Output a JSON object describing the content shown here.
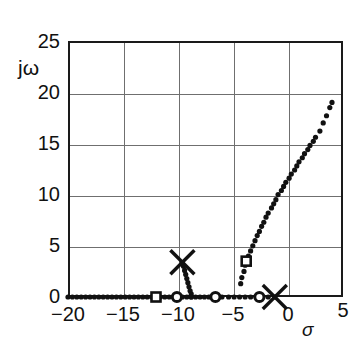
{
  "chart_data": {
    "type": "scatter",
    "title": "",
    "subtitle": "",
    "xlabel": "σ",
    "ylabel": "jω",
    "xlim": [
      -20,
      5
    ],
    "ylim": [
      0,
      25
    ],
    "xticks": [
      -20,
      -15,
      -10,
      -5,
      0,
      5
    ],
    "xticklabels": [
      "−20",
      "−15",
      "−10",
      "−5",
      "0",
      "5"
    ],
    "yticks": [
      0,
      5,
      10,
      15,
      20,
      25
    ],
    "yticklabels": [
      "0",
      "5",
      "10",
      "15",
      "20",
      "25"
    ],
    "grid": true,
    "grid_color": "#6f6f6f",
    "frame_color": "#1a1a1a",
    "legend": "none",
    "series": [
      {
        "name": "real-axis-locus",
        "marker": "dot",
        "color": "#111111",
        "points": [
          [
            -20.0,
            0
          ],
          [
            -19.6,
            0
          ],
          [
            -19.2,
            0
          ],
          [
            -18.8,
            0
          ],
          [
            -18.4,
            0
          ],
          [
            -18.0,
            0
          ],
          [
            -17.6,
            0
          ],
          [
            -17.2,
            0
          ],
          [
            -16.8,
            0
          ],
          [
            -16.4,
            0
          ],
          [
            -16.0,
            0
          ],
          [
            -15.6,
            0
          ],
          [
            -15.2,
            0
          ],
          [
            -14.8,
            0
          ],
          [
            -14.4,
            0
          ],
          [
            -14.0,
            0
          ],
          [
            -13.6,
            0
          ],
          [
            -13.2,
            0
          ],
          [
            -12.8,
            0
          ],
          [
            -12.4,
            0
          ],
          [
            -12.0,
            0
          ],
          [
            -11.6,
            0
          ],
          [
            -11.2,
            0
          ],
          [
            -10.8,
            0
          ],
          [
            -10.4,
            0
          ],
          [
            -10.0,
            0
          ],
          [
            -9.6,
            0
          ],
          [
            -9.2,
            0
          ],
          [
            -8.8,
            0
          ],
          [
            -8.4,
            0
          ],
          [
            -8.0,
            0
          ],
          [
            -7.6,
            0
          ],
          [
            -7.2,
            0
          ],
          [
            -6.8,
            0
          ],
          [
            -6.4,
            0
          ],
          [
            -6.0,
            0
          ],
          [
            -5.4,
            0
          ],
          [
            -4.9,
            0
          ],
          [
            -4.4,
            0
          ],
          [
            -3.9,
            0
          ],
          [
            -3.4,
            0
          ],
          [
            -2.9,
            0
          ],
          [
            -2.3,
            0
          ],
          [
            -1.8,
            0
          ],
          [
            -1.2,
            0
          ]
        ]
      },
      {
        "name": "upper-branch-locus",
        "marker": "dot",
        "color": "#111111",
        "points": [
          [
            -4.3,
            1.3
          ],
          [
            -4.2,
            1.9
          ],
          [
            -4.0,
            2.5
          ],
          [
            -3.9,
            3.1
          ],
          [
            -3.8,
            3.5
          ],
          [
            -3.6,
            4.0
          ],
          [
            -3.4,
            4.5
          ],
          [
            -3.2,
            5.0
          ],
          [
            -3.0,
            5.5
          ],
          [
            -2.8,
            6.0
          ],
          [
            -2.6,
            6.4
          ],
          [
            -2.4,
            6.9
          ],
          [
            -2.2,
            7.3
          ],
          [
            -2.0,
            7.8
          ],
          [
            -1.8,
            8.2
          ],
          [
            -1.5,
            8.7
          ],
          [
            -1.3,
            9.1
          ],
          [
            -1.1,
            9.5
          ],
          [
            -0.9,
            10.0
          ],
          [
            -0.6,
            10.4
          ],
          [
            -0.4,
            10.8
          ],
          [
            -0.2,
            11.2
          ],
          [
            0.1,
            11.6
          ],
          [
            0.3,
            12.0
          ],
          [
            0.6,
            12.4
          ],
          [
            0.8,
            12.8
          ],
          [
            1.0,
            13.2
          ],
          [
            1.3,
            13.6
          ],
          [
            1.5,
            14.0
          ],
          [
            1.8,
            14.4
          ],
          [
            2.0,
            14.8
          ],
          [
            2.3,
            15.2
          ],
          [
            2.5,
            15.6
          ],
          [
            2.9,
            16.2
          ],
          [
            3.2,
            17.0
          ],
          [
            3.5,
            17.7
          ],
          [
            3.8,
            18.5
          ],
          [
            4.0,
            19.0
          ]
        ]
      },
      {
        "name": "breakaway-branch-locus",
        "marker": "dot",
        "color": "#111111",
        "points": [
          [
            -9.6,
            3.3
          ],
          [
            -9.5,
            3.0
          ],
          [
            -9.4,
            2.6
          ],
          [
            -9.3,
            2.2
          ],
          [
            -9.2,
            1.8
          ],
          [
            -9.1,
            1.4
          ],
          [
            -9.0,
            1.0
          ],
          [
            -8.9,
            0.6
          ],
          [
            -8.8,
            0.3
          ],
          [
            -8.8,
            0.0
          ]
        ]
      },
      {
        "name": "open-loop-poles",
        "marker": "x-cross",
        "color": "#111111",
        "points": [
          [
            -9.6,
            3.4
          ],
          [
            -1.2,
            0.0
          ]
        ]
      },
      {
        "name": "open-circle-markers",
        "marker": "open-circle",
        "color": "#111111",
        "points": [
          [
            -10.1,
            0.0
          ],
          [
            -6.6,
            0.0
          ],
          [
            -2.6,
            0.0
          ]
        ]
      },
      {
        "name": "open-square-markers",
        "marker": "open-square",
        "color": "#111111",
        "points": [
          [
            -12.0,
            0.0
          ],
          [
            -3.8,
            3.5
          ]
        ]
      }
    ],
    "annotations": []
  }
}
